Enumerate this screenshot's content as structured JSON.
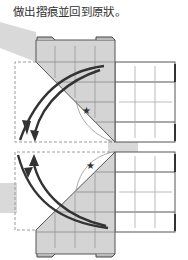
{
  "caption": "做出摺痕並回到原狀。",
  "diagram": {
    "type": "origami-fold-instruction",
    "steps": [
      {
        "name": "fold-top-flap",
        "marker": "star"
      },
      {
        "name": "fold-bottom-flap",
        "marker": "star"
      }
    ],
    "colors": {
      "paper_shaded": "#d4d4d4",
      "paper_white": "#ffffff",
      "outline": "#555555",
      "arrow": "#333333",
      "highlight_band": "#d9d9d9",
      "dashed": "#9a9a9a"
    }
  }
}
